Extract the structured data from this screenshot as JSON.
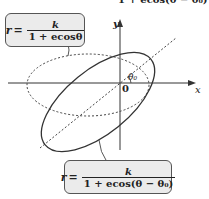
{
  "top_clipped_text": "1 + ecos(θ − θ₀)",
  "formula_box_1": {
    "lhs": "r",
    "eq": "=",
    "numerator": "k",
    "denominator": "1 + ecosθ"
  },
  "formula_box_2": {
    "lhs": "r",
    "eq": "=",
    "numerator": "k",
    "denominator": "1 + ecos(θ − θ₀)"
  },
  "axes": {
    "x_label": "x",
    "y_label": "y",
    "origin_label": "0"
  },
  "angle_label": "θ₀",
  "colors": {
    "stroke": "#333333",
    "box_fill": "#ebebeb"
  }
}
